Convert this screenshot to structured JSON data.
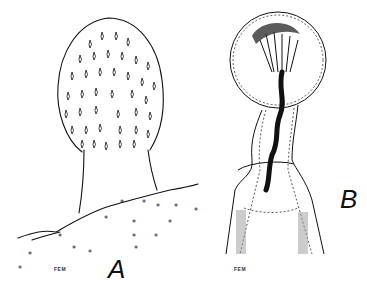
{
  "figure": {
    "panels": [
      {
        "id": "A",
        "label": "A",
        "signature": "FEM",
        "subject": "stalked ovoid body with scattered teardrop spines on textured surface"
      },
      {
        "id": "B",
        "label": "B",
        "signature": "FEM",
        "subject": "bulbous head with radiating internal strands and dark coiled canal in tubular stalk"
      }
    ],
    "colors": {
      "ink": "#111111",
      "background": "#ffffff",
      "stipple": "#888888"
    }
  }
}
